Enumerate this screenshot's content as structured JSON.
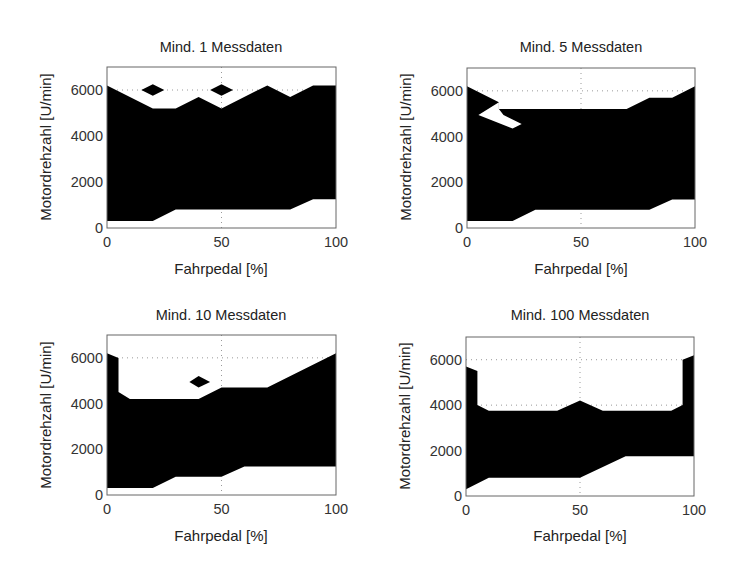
{
  "figure": {
    "background": "#ffffff",
    "fill_color": "#000000"
  },
  "chart_data": [
    {
      "type": "area",
      "title": "Mind. 1 Messdaten",
      "xlabel": "Fahrpedal [%]",
      "ylabel": "Motordrehzahl [U/min]",
      "xlim": [
        0,
        100
      ],
      "ylim": [
        0,
        7000
      ],
      "xticks": [
        0,
        50,
        100
      ],
      "yticks": [
        0,
        2000,
        4000,
        6000
      ],
      "grid": {
        "x": [
          50
        ],
        "y": [
          6000
        ]
      },
      "upper": [
        [
          0,
          6200
        ],
        [
          20,
          5200
        ],
        [
          30,
          5200
        ],
        [
          40,
          5700
        ],
        [
          50,
          5200
        ],
        [
          70,
          6200
        ],
        [
          80,
          5700
        ],
        [
          90,
          6200
        ],
        [
          100,
          6200
        ]
      ],
      "lower": [
        [
          0,
          300
        ],
        [
          20,
          300
        ],
        [
          30,
          800
        ],
        [
          80,
          800
        ],
        [
          90,
          1250
        ],
        [
          100,
          1250
        ]
      ],
      "islands": [
        [
          [
            15,
            6000
          ],
          [
            20,
            6250
          ],
          [
            25,
            6000
          ],
          [
            20,
            5750
          ]
        ],
        [
          [
            45,
            6000
          ],
          [
            50,
            6250
          ],
          [
            55,
            6000
          ],
          [
            50,
            5750
          ]
        ]
      ],
      "holes": []
    },
    {
      "type": "area",
      "title": "Mind. 5 Messdaten",
      "xlabel": "Fahrpedal [%]",
      "ylabel": "Motordrehzahl [U/min]",
      "xlim": [
        0,
        100
      ],
      "ylim": [
        0,
        7000
      ],
      "xticks": [
        0,
        50,
        100
      ],
      "yticks": [
        0,
        2000,
        4000,
        6000
      ],
      "grid": {
        "x": [
          50
        ],
        "y": [
          6000
        ]
      },
      "upper": [
        [
          0,
          6200
        ],
        [
          14,
          5500
        ],
        [
          14,
          5200
        ],
        [
          70,
          5200
        ],
        [
          80,
          5700
        ],
        [
          90,
          5700
        ],
        [
          100,
          6200
        ]
      ],
      "lower": [
        [
          0,
          300
        ],
        [
          20,
          300
        ],
        [
          30,
          800
        ],
        [
          80,
          800
        ],
        [
          90,
          1250
        ],
        [
          100,
          1250
        ]
      ],
      "islands": [],
      "holes": [
        [
          [
            14,
            5500
          ],
          [
            5,
            4950
          ],
          [
            20,
            4350
          ],
          [
            24,
            4550
          ],
          [
            16,
            4950
          ],
          [
            14,
            5200
          ]
        ]
      ]
    },
    {
      "type": "area",
      "title": "Mind. 10 Messdaten",
      "xlabel": "Fahrpedal [%]",
      "ylabel": "Motordrehzahl [U/min]",
      "xlim": [
        0,
        100
      ],
      "ylim": [
        0,
        7000
      ],
      "xticks": [
        0,
        50,
        100
      ],
      "yticks": [
        0,
        2000,
        4000,
        6000
      ],
      "grid": {
        "x": [
          50
        ],
        "y": [
          6000
        ]
      },
      "upper": [
        [
          0,
          6200
        ],
        [
          5,
          6000
        ],
        [
          5,
          4500
        ],
        [
          10,
          4200
        ],
        [
          40,
          4200
        ],
        [
          50,
          4700
        ],
        [
          70,
          4700
        ],
        [
          100,
          6200
        ]
      ],
      "lower": [
        [
          0,
          300
        ],
        [
          20,
          300
        ],
        [
          30,
          800
        ],
        [
          50,
          800
        ],
        [
          60,
          1250
        ],
        [
          100,
          1250
        ]
      ],
      "islands": [
        [
          [
            36,
            4950
          ],
          [
            40,
            5200
          ],
          [
            45,
            4950
          ],
          [
            40,
            4700
          ]
        ]
      ],
      "holes": []
    },
    {
      "type": "area",
      "title": "Mind. 100 Messdaten",
      "xlabel": "Fahrpedal [%]",
      "ylabel": "Motordrehzahl [U/min]",
      "xlim": [
        0,
        100
      ],
      "ylim": [
        0,
        7000
      ],
      "xticks": [
        0,
        50,
        100
      ],
      "yticks": [
        0,
        2000,
        4000,
        6000
      ],
      "grid": {
        "x": [
          50
        ],
        "y": [
          4000,
          6000
        ]
      },
      "upper": [
        [
          0,
          5700
        ],
        [
          5,
          5500
        ],
        [
          5,
          4000
        ],
        [
          10,
          3750
        ],
        [
          40,
          3750
        ],
        [
          50,
          4200
        ],
        [
          60,
          3750
        ],
        [
          90,
          3750
        ],
        [
          95,
          4000
        ],
        [
          95,
          6000
        ],
        [
          100,
          6200
        ]
      ],
      "lower": [
        [
          0,
          300
        ],
        [
          10,
          800
        ],
        [
          50,
          800
        ],
        [
          70,
          1750
        ],
        [
          100,
          1750
        ]
      ],
      "islands": [],
      "holes": []
    }
  ]
}
